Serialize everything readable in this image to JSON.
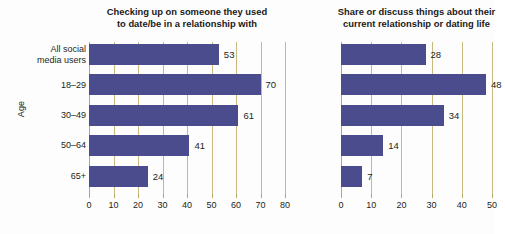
{
  "axis_title_y": "Age",
  "categories": [
    "All social\nmedia users",
    "18–29",
    "30–49",
    "50–64",
    "65+"
  ],
  "colors": {
    "bar": "#4b4c8e",
    "gridline": "#c8b97e",
    "text": "#231f20",
    "background": "#fdfdfd"
  },
  "chart_data": [
    {
      "type": "bar",
      "orientation": "horizontal",
      "title": "Checking up on someone they used\nto date/be in a relationship with",
      "xlabel": "",
      "ylabel": "Age",
      "categories": [
        "All social media users",
        "18-29",
        "30-49",
        "50-64",
        "65+"
      ],
      "values": [
        53,
        70,
        61,
        41,
        24
      ],
      "xlim": [
        0,
        80
      ],
      "xticks": [
        0,
        10,
        20,
        30,
        40,
        50,
        60,
        70,
        80
      ],
      "xticklabels": [
        "0",
        "10",
        "20",
        "30",
        "40",
        "50",
        "60",
        "70",
        "80"
      ],
      "grid": true,
      "legend": false,
      "data_labels": [
        "53",
        "70",
        "61",
        "41",
        "24"
      ]
    },
    {
      "type": "bar",
      "orientation": "horizontal",
      "title": "Share or discuss things about their\ncurrent relationship or dating life",
      "xlabel": "",
      "ylabel": "",
      "categories": [
        "All social media users",
        "18-29",
        "30-49",
        "50-64",
        "65+"
      ],
      "values": [
        28,
        48,
        34,
        14,
        7
      ],
      "xlim": [
        0,
        50
      ],
      "xticks": [
        0,
        10,
        20,
        30,
        40,
        50
      ],
      "xticklabels": [
        "0",
        "10",
        "20",
        "30",
        "40",
        "50"
      ],
      "grid": true,
      "legend": false,
      "data_labels": [
        "28",
        "48",
        "34",
        "14",
        "7"
      ]
    }
  ]
}
